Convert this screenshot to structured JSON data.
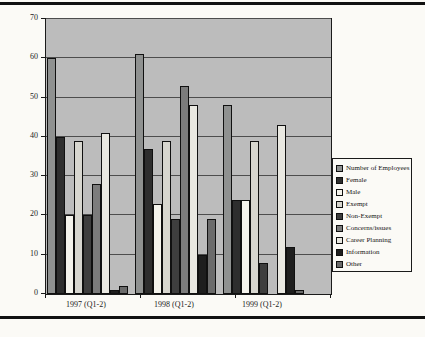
{
  "chart_data": {
    "type": "bar",
    "title": "",
    "xlabel": "",
    "ylabel": "",
    "categories": [
      "1997 (Q1-2)",
      "1998 (Q1-2)",
      "1999 (Q1-2)"
    ],
    "series": [
      {
        "name": "Number of Employees",
        "color": "#8f9190",
        "values": [
          60,
          61,
          48
        ]
      },
      {
        "name": "Female",
        "color": "#2e2e2e",
        "values": [
          40,
          37,
          24
        ]
      },
      {
        "name": "Male",
        "color": "#f4f3ec",
        "values": [
          20,
          23,
          24
        ]
      },
      {
        "name": "Exempt",
        "color": "#d7d6cf",
        "values": [
          39,
          39,
          39
        ]
      },
      {
        "name": "Non-Exempt",
        "color": "#3e3e3e",
        "values": [
          20,
          19,
          8
        ]
      },
      {
        "name": "Concerns/issues",
        "color": "#7c7c7c",
        "values": [
          28,
          53,
          0
        ]
      },
      {
        "name": "Career Planning",
        "color": "#e9e8e1",
        "values": [
          41,
          48,
          43
        ]
      },
      {
        "name": "Information",
        "color": "#1e1e1e",
        "values": [
          1,
          10,
          12
        ]
      },
      {
        "name": "Other",
        "color": "#6b6b6b",
        "values": [
          2,
          19,
          1
        ]
      }
    ],
    "ylim": [
      0,
      70
    ],
    "yticks": [
      0,
      10,
      20,
      30,
      40,
      50,
      60,
      70
    ],
    "grid": true,
    "plot_background": "#bcbcbc",
    "legend_position": "right"
  }
}
